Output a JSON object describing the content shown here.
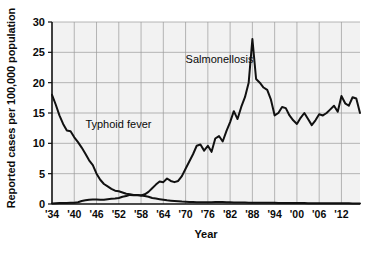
{
  "chart_data": {
    "type": "line",
    "title": "",
    "xlabel": "Year",
    "ylabel": "Reported cases per 100,000 population",
    "xlim": [
      1934,
      1917
    ],
    "ylim": [
      0,
      30
    ],
    "grid": true,
    "legend_position": "inline-annotation",
    "yticks": [
      "0",
      "5",
      "10",
      "15",
      "20",
      "25",
      "30"
    ],
    "ytick_values": [
      0,
      5,
      10,
      15,
      20,
      25,
      30
    ],
    "xticks": [
      "'34",
      "'40",
      "'46",
      "'52",
      "'58",
      "'64",
      "'70",
      "'76",
      "'82",
      "'88",
      "'94",
      "'00",
      "'06",
      "'12"
    ],
    "xtick_values": [
      1934,
      1940,
      1946,
      1952,
      1958,
      1964,
      1970,
      1976,
      1982,
      1988,
      1994,
      2000,
      2006,
      2012
    ],
    "x_start": 1934,
    "x_end": 2017,
    "annotations": [
      {
        "text": "Typhoid fever",
        "x": 1943,
        "y": 12.6
      },
      {
        "text": "Salmonellosis",
        "x": 1970,
        "y": 23.3
      }
    ],
    "series": [
      {
        "name": "Typhoid fever",
        "color": "#111111",
        "x": [
          1934,
          1935,
          1936,
          1937,
          1938,
          1939,
          1940,
          1941,
          1942,
          1943,
          1944,
          1945,
          1946,
          1947,
          1948,
          1949,
          1950,
          1951,
          1952,
          1953,
          1954,
          1955,
          1956,
          1957,
          1958,
          1959,
          1960,
          1961,
          1962,
          1963,
          1964,
          1965,
          1966,
          1967,
          1968,
          1969,
          1970,
          1971,
          1972,
          1973,
          1974,
          1975,
          1976,
          1977,
          1978,
          1979,
          1980,
          1981,
          1982,
          1983,
          1984,
          1985,
          1986,
          1987,
          1988,
          1989,
          1990,
          1991,
          1992,
          1993,
          1994,
          1995,
          1996,
          1997,
          1998,
          1999,
          2000,
          2001,
          2002,
          2003,
          2004,
          2005,
          2006,
          2007,
          2008,
          2009,
          2010,
          2011,
          2012,
          2013,
          2014,
          2015,
          2016,
          2017
        ],
        "values": [
          18.0,
          16.4,
          14.6,
          13.2,
          12.1,
          12.0,
          11.0,
          10.2,
          9.3,
          8.3,
          7.2,
          6.4,
          5.0,
          4.0,
          3.3,
          2.9,
          2.5,
          2.2,
          2.1,
          1.9,
          1.7,
          1.6,
          1.5,
          1.5,
          1.4,
          1.3,
          1.2,
          1.0,
          0.9,
          0.8,
          0.7,
          0.6,
          0.55,
          0.5,
          0.45,
          0.4,
          0.38,
          0.35,
          0.33,
          0.3,
          0.3,
          0.3,
          0.28,
          0.3,
          0.32,
          0.35,
          0.33,
          0.3,
          0.28,
          0.26,
          0.25,
          0.24,
          0.23,
          0.22,
          0.22,
          0.21,
          0.2,
          0.2,
          0.2,
          0.2,
          0.19,
          0.18,
          0.18,
          0.17,
          0.17,
          0.16,
          0.16,
          0.15,
          0.15,
          0.14,
          0.14,
          0.13,
          0.13,
          0.13,
          0.12,
          0.12,
          0.12,
          0.12,
          0.11,
          0.11,
          0.11,
          0.1,
          0.1,
          0.1
        ]
      },
      {
        "name": "Salmonellosis",
        "color": "#111111",
        "x": [
          1934,
          1935,
          1936,
          1937,
          1938,
          1939,
          1940,
          1941,
          1942,
          1943,
          1944,
          1945,
          1946,
          1947,
          1948,
          1949,
          1950,
          1951,
          1952,
          1953,
          1954,
          1955,
          1956,
          1957,
          1958,
          1959,
          1960,
          1961,
          1962,
          1963,
          1964,
          1965,
          1966,
          1967,
          1968,
          1969,
          1970,
          1971,
          1972,
          1973,
          1974,
          1975,
          1976,
          1977,
          1978,
          1979,
          1980,
          1981,
          1982,
          1983,
          1984,
          1985,
          1986,
          1987,
          1988,
          1989,
          1990,
          1991,
          1992,
          1993,
          1994,
          1995,
          1996,
          1997,
          1998,
          1999,
          2000,
          2001,
          2002,
          2003,
          2004,
          2005,
          2006,
          2007,
          2008,
          2009,
          2010,
          2011,
          2012,
          2013,
          2014,
          2015,
          2016,
          2017
        ],
        "values": [
          0.1,
          0.12,
          0.15,
          0.15,
          0.18,
          0.2,
          0.2,
          0.3,
          0.5,
          0.6,
          0.7,
          0.75,
          0.75,
          0.7,
          0.7,
          0.8,
          0.85,
          0.9,
          1.0,
          1.2,
          1.3,
          1.5,
          1.45,
          1.5,
          1.4,
          1.6,
          2.0,
          2.6,
          3.2,
          3.7,
          3.6,
          4.2,
          3.8,
          3.6,
          3.8,
          4.6,
          5.8,
          7.0,
          8.2,
          9.6,
          9.8,
          8.8,
          9.6,
          8.6,
          10.8,
          11.2,
          10.3,
          12.0,
          13.5,
          15.3,
          14.0,
          16.0,
          17.6,
          20.0,
          27.2,
          20.6,
          20.0,
          19.2,
          18.8,
          17.2,
          14.6,
          15.0,
          16.0,
          15.8,
          14.6,
          13.8,
          13.2,
          14.2,
          15.0,
          14.0,
          13.0,
          13.8,
          14.8,
          14.6,
          15.0,
          15.6,
          16.2,
          15.2,
          17.8,
          16.6,
          16.2,
          17.6,
          17.4,
          15.0
        ]
      }
    ]
  },
  "axis": {
    "ylabel_text": "Reported cases per 100,000 population",
    "xlabel_text": "Year"
  }
}
